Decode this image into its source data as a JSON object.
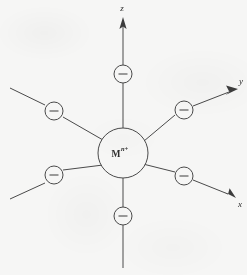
{
  "figure": {
    "background_color": "#f6f6f5",
    "line_color": "#4a4a4a",
    "text_color": "#2e2e2e"
  },
  "center": {
    "label_element": "M",
    "label_charge": "n+",
    "cx": 123,
    "cy": 153,
    "r": 25
  },
  "axes": [
    {
      "name": "z",
      "label": "z",
      "label_x": 122,
      "label_y": 11,
      "x1": 123,
      "y1": 26,
      "x2": 123,
      "y2": 268,
      "arrow": "up"
    },
    {
      "name": "y",
      "label": "y",
      "label_x": 239,
      "label_y": 84,
      "x1": 10,
      "y1": 199,
      "x2": 238,
      "y2": 89,
      "arrow": "upper-right"
    },
    {
      "name": "x",
      "label": "x",
      "label_x": 238,
      "label_y": 207,
      "x1": 10,
      "y1": 88,
      "x2": 236,
      "y2": 198,
      "arrow": "lower-right"
    }
  ],
  "ligands": [
    {
      "name": "ligand-top",
      "sign": "−",
      "cx": 123,
      "cy": 74,
      "r": 9
    },
    {
      "name": "ligand-bottom",
      "sign": "−",
      "cx": 123,
      "cy": 216,
      "r": 9
    },
    {
      "name": "ligand-upper-left",
      "sign": "−",
      "cx": 54,
      "cy": 111,
      "r": 9
    },
    {
      "name": "ligand-upper-right",
      "sign": "−",
      "cx": 184,
      "cy": 110,
      "r": 9
    },
    {
      "name": "ligand-lower-left",
      "sign": "−",
      "cx": 54,
      "cy": 175,
      "r": 9
    },
    {
      "name": "ligand-lower-right",
      "sign": "−",
      "cx": 184,
      "cy": 176,
      "r": 9
    }
  ]
}
